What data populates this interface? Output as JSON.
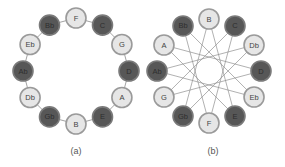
{
  "colors": {
    "light_fill": "#e6e6e6",
    "dark_fill": "#575757",
    "edge": "#8a8a8a",
    "background": "#ffffff"
  },
  "diagrams": [
    {
      "id": "a",
      "caption": "(a)",
      "layout": "circle-of-fifths",
      "center": [
        76,
        71
      ],
      "radius": 53,
      "connection": "adjacent",
      "nodes": [
        {
          "label": "F",
          "shade": "light"
        },
        {
          "label": "C",
          "shade": "dark"
        },
        {
          "label": "G",
          "shade": "light"
        },
        {
          "label": "D",
          "shade": "dark"
        },
        {
          "label": "A",
          "shade": "light"
        },
        {
          "label": "E",
          "shade": "dark"
        },
        {
          "label": "B",
          "shade": "light"
        },
        {
          "label": "Gb",
          "shade": "dark"
        },
        {
          "label": "Db",
          "shade": "light"
        },
        {
          "label": "Ab",
          "shade": "dark"
        },
        {
          "label": "Eb",
          "shade": "light"
        },
        {
          "label": "Bb",
          "shade": "dark"
        }
      ]
    },
    {
      "id": "b",
      "caption": "(b)",
      "layout": "chromatic-circle",
      "center": [
        209,
        71
      ],
      "radius": 52,
      "connection": "star-12-5",
      "nodes": [
        {
          "label": "B",
          "shade": "light"
        },
        {
          "label": "C",
          "shade": "dark"
        },
        {
          "label": "Db",
          "shade": "light"
        },
        {
          "label": "D",
          "shade": "dark"
        },
        {
          "label": "Eb",
          "shade": "light"
        },
        {
          "label": "E",
          "shade": "dark"
        },
        {
          "label": "F",
          "shade": "light"
        },
        {
          "label": "Gb",
          "shade": "dark"
        },
        {
          "label": "G",
          "shade": "light"
        },
        {
          "label": "Ab",
          "shade": "dark"
        },
        {
          "label": "A",
          "shade": "light"
        },
        {
          "label": "Bb",
          "shade": "dark"
        }
      ]
    }
  ]
}
